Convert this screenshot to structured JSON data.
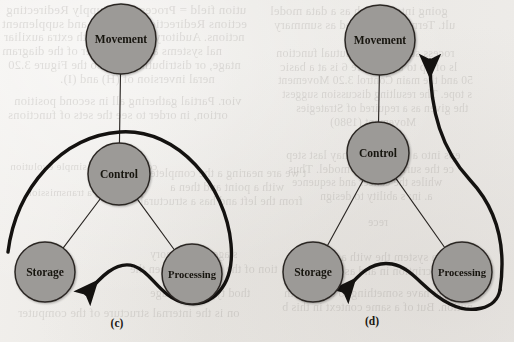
{
  "figure": {
    "page_background": "#eeecea",
    "node_fill": "#9c9a97",
    "node_stroke": "#2b2724",
    "line_color": "#2b2724",
    "thick_curve_color": "#141210",
    "subfigures": [
      {
        "id": "c",
        "caption": "(c)",
        "caption_x": 117,
        "caption_y": 327,
        "nodes": [
          {
            "name": "movement",
            "label": "Movement",
            "cx": 121,
            "cy": 39,
            "r": 35
          },
          {
            "name": "control",
            "label": "Control",
            "cx": 119,
            "cy": 174,
            "r": 31
          },
          {
            "name": "storage",
            "label": "Storage",
            "cx": 45,
            "cy": 272,
            "r": 30
          },
          {
            "name": "processing",
            "label": "Processing",
            "cx": 192,
            "cy": 274,
            "r": 30
          }
        ],
        "edges": [
          {
            "name": "movement-control",
            "from": "movement",
            "to": "control"
          },
          {
            "name": "control-storage",
            "from": "control",
            "to": "storage"
          },
          {
            "name": "control-processing",
            "from": "control",
            "to": "processing"
          }
        ],
        "flow_arrow": {
          "name": "feedback-loop-arrow",
          "arrow_direction": "down-left",
          "path": "M 8 252 C 16 188, 62 136, 120 132 C 178 128, 226 186, 231 244 C 235 288, 210 308, 186 303 C 160 298, 152 272, 134 266 C 116 260, 100 278, 86 294"
        }
      },
      {
        "id": "d",
        "caption": "(d)",
        "caption_x": 372,
        "caption_y": 325,
        "nodes": [
          {
            "name": "movement",
            "label": "Movement",
            "cx": 380,
            "cy": 40,
            "r": 35
          },
          {
            "name": "control",
            "label": "Control",
            "cx": 378,
            "cy": 153,
            "r": 31
          },
          {
            "name": "storage",
            "label": "Storage",
            "cx": 313,
            "cy": 272,
            "r": 30
          },
          {
            "name": "processing",
            "label": "Processing",
            "cx": 462,
            "cy": 272,
            "r": 30
          }
        ],
        "edges": [
          {
            "name": "movement-control",
            "from": "movement",
            "to": "control"
          },
          {
            "name": "control-storage",
            "from": "control",
            "to": "storage"
          },
          {
            "name": "control-processing",
            "from": "control",
            "to": "processing"
          }
        ],
        "flow_arrow_up": {
          "name": "movement-feedback-arrow",
          "arrow_direction": "up",
          "path": "M 500 290 C 506 250, 500 212, 470 180 C 442 150, 430 112, 430 60"
        },
        "flow_arrow_down": {
          "name": "feedback-loop-arrow",
          "arrow_direction": "down-left",
          "path": "M 500 290 C 496 310, 470 314, 450 304 C 424 292, 414 268, 392 264 C 370 260, 356 278, 344 292"
        }
      }
    ]
  },
  "bleed_text": {
    "note": "faint mirrored show-through text from the reverse side of the printed page",
    "lines": [
      {
        "text": "ution field = Processing; Supply Redirecting",
        "x": 6,
        "y": 2,
        "size": 13
      },
      {
        "text": "ections Redirection; Transfer and supplement",
        "x": 2,
        "y": 16,
        "size": 13
      },
      {
        "text": "nctions. Auditory functions with extra auxiliar",
        "x": 4,
        "y": 30,
        "size": 12.5
      },
      {
        "text": "nal systems are for transfer of the diagram",
        "x": 2,
        "y": 44,
        "size": 12.5
      },
      {
        "text": "ntage, or distributing to; also the Figure 3.20",
        "x": 8,
        "y": 58,
        "size": 12.5
      },
      {
        "text": "neral inversion of (H) and (I).",
        "x": 60,
        "y": 72,
        "size": 12.5
      },
      {
        "text": "vior. Partial gathering all in second position",
        "x": 14,
        "y": 94,
        "size": 12.5
      },
      {
        "text": "ortion, in order to see the sets of functions",
        "x": 8,
        "y": 108,
        "size": 12.5
      },
      {
        "text": "controlling the simple evolution",
        "x": 10,
        "y": 160,
        "size": 11
      },
      {
        "text": "processing a transmission",
        "x": 26,
        "y": 186,
        "size": 11
      },
      {
        "text": "t we are nearing a the complete",
        "x": 150,
        "y": 166,
        "size": 12
      },
      {
        "text": "with a point and then a",
        "x": 170,
        "y": 180,
        "size": 12
      },
      {
        "text": "from the left and has a structural",
        "x": 140,
        "y": 194,
        "size": 12
      },
      {
        "text": "stage and memory",
        "x": 150,
        "y": 248,
        "size": 11.5
      },
      {
        "text": "tion of the computer, then the",
        "x": 130,
        "y": 262,
        "size": 12
      },
      {
        "text": "thod type of linkage",
        "x": 150,
        "y": 286,
        "size": 12
      },
      {
        "text": "on is the internal structure of the computer",
        "x": 18,
        "y": 306,
        "size": 12.5
      },
      {
        "text": "going into a much as a data model",
        "x": 270,
        "y": 4,
        "size": 12.5
      },
      {
        "text": "ult. Terms are allowed as summary",
        "x": 274,
        "y": 18,
        "size": 12.5
      },
      {
        "text": "rocess structure for mutual function",
        "x": 276,
        "y": 46,
        "size": 12
      },
      {
        "text": "ls of up to a C Figure 6 is at a basic",
        "x": 280,
        "y": 60,
        "size": 12
      },
      {
        "text": "50 and the main Control 3.20 Movement",
        "x": 278,
        "y": 74,
        "size": 11.5
      },
      {
        "text": "s tope. The resulting discussion suggest",
        "x": 282,
        "y": 88,
        "size": 11.5
      },
      {
        "text": "the given as a required of Strategies",
        "x": 296,
        "y": 102,
        "size": 11.5
      },
      {
        "text": "Movement (1980)",
        "x": 330,
        "y": 116,
        "size": 11.5
      },
      {
        "text": "eps into a cluster this may last step",
        "x": 286,
        "y": 148,
        "size": 12
      },
      {
        "text": "ce the surface of the model. Thus",
        "x": 288,
        "y": 162,
        "size": 12
      },
      {
        "text": "whiles the cancer and sequence",
        "x": 292,
        "y": 176,
        "size": 11.5
      },
      {
        "text": "a. in: s ability to design",
        "x": 320,
        "y": 190,
        "size": 11.5
      },
      {
        "text": "rece",
        "x": 368,
        "y": 216,
        "size": 11.5
      },
      {
        "text": "ns of a system the with a particular",
        "x": 290,
        "y": 250,
        "size": 12
      },
      {
        "text": "description in and as, then these",
        "x": 288,
        "y": 264,
        "size": 12
      },
      {
        "text": "we, yet have something to an. A with",
        "x": 284,
        "y": 286,
        "size": 12
      },
      {
        "text": "nution. But of a same context in this b",
        "x": 282,
        "y": 300,
        "size": 12
      }
    ]
  }
}
